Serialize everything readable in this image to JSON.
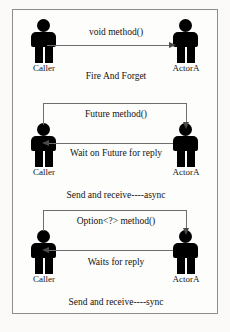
{
  "diagram": {
    "colors": {
      "background": "#fbfaf8",
      "frame_border": "#8d8d8d",
      "figure": "#000000",
      "connector": "#6e6e6e",
      "text": "#131313"
    },
    "panels": [
      {
        "id": "fire-and-forget",
        "caption": "Fire And Forget",
        "messages": [
          {
            "label": "void method()",
            "direction": "caller-to-actor",
            "style": "straight"
          }
        ],
        "actors": [
          {
            "id": "caller",
            "label": "Caller",
            "side": "left"
          },
          {
            "id": "actora",
            "label": "ActorA",
            "side": "right"
          }
        ]
      },
      {
        "id": "async",
        "caption": "Send and receive----async",
        "messages": [
          {
            "label": "Future method()",
            "direction": "caller-to-actor",
            "style": "over-the-top"
          },
          {
            "label": "Wait on Future for reply",
            "direction": "actor-to-caller",
            "style": "straight"
          }
        ],
        "actors": [
          {
            "id": "caller",
            "label": "Caller",
            "side": "left"
          },
          {
            "id": "actora",
            "label": "ActorA",
            "side": "right"
          }
        ]
      },
      {
        "id": "sync",
        "caption": "Send and receive----sync",
        "messages": [
          {
            "label": "Option<?> method()",
            "direction": "caller-to-actor",
            "style": "over-the-top"
          },
          {
            "label": "Waits for reply",
            "direction": "actor-to-caller",
            "style": "straight"
          }
        ],
        "actors": [
          {
            "id": "caller",
            "label": "Caller",
            "side": "left"
          },
          {
            "id": "actora",
            "label": "ActorA",
            "side": "right"
          }
        ]
      }
    ]
  }
}
